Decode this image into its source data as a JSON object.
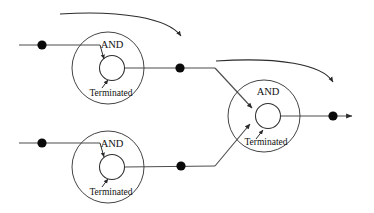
{
  "diagram": {
    "type": "workflow-petri-net",
    "colors": {
      "wire": "#4d4d4d",
      "stroke": "#2b2b2b",
      "dot": "#0a0a0a",
      "background": "#ffffff",
      "text": "#111111"
    },
    "nodes": [
      {
        "id": "node-top-left",
        "gate_label": "AND",
        "state_label": "Terminated",
        "cx": 108,
        "cy": 68,
        "outer_r": 36,
        "inner_cx": 112,
        "inner_cy": 68,
        "inner_r": 12.5
      },
      {
        "id": "node-bottom-left",
        "gate_label": "AND",
        "state_label": "Terminated",
        "cx": 108,
        "cy": 167,
        "outer_r": 36,
        "inner_cx": 112,
        "inner_cy": 167,
        "inner_r": 12.5
      },
      {
        "id": "node-right",
        "gate_label": "AND",
        "state_label": "Terminated",
        "cx": 264,
        "cy": 116,
        "outer_r": 36,
        "inner_cx": 268,
        "inner_cy": 116,
        "inner_r": 12.5
      }
    ],
    "tokens": [
      {
        "id": "token-input-top",
        "cx": 42,
        "cy": 45,
        "r": 4.6
      },
      {
        "id": "token-input-bottom",
        "cx": 42,
        "cy": 143,
        "r": 4.6
      },
      {
        "id": "token-output-top",
        "cx": 180,
        "cy": 68,
        "r": 4.6
      },
      {
        "id": "token-output-bottom",
        "cx": 181,
        "cy": 166,
        "r": 4.6
      },
      {
        "id": "token-output-final",
        "cx": 333,
        "cy": 116,
        "r": 4.6
      }
    ],
    "wires": [
      {
        "id": "wire-input-top",
        "d": "M 19 45 L 100 45"
      },
      {
        "id": "wire-input-bottom",
        "d": "M 19 143 L 100 143"
      },
      {
        "id": "wire-out-top",
        "d": "M 124 68 L 215 68"
      },
      {
        "id": "wire-out-bottom",
        "d": "M 124 167 L 215 166"
      },
      {
        "id": "wire-join-top",
        "d": "M 215 68 L 252 108"
      },
      {
        "id": "wire-join-bottom",
        "d": "M 215 166 L 250 124"
      },
      {
        "id": "wire-out-final",
        "d": "M 281 116 L 352 116"
      }
    ],
    "internal_arrows": [
      {
        "id": "arrow-top-and",
        "d": "M 100 45 L 104 59"
      },
      {
        "id": "arrow-top-term",
        "d": "M 102 88 L 108 80"
      },
      {
        "id": "arrow-bottom-and",
        "d": "M 100 143 L 104 157"
      },
      {
        "id": "arrow-bottom-term",
        "d": "M 102 187 L 108 179"
      },
      {
        "id": "arrow-right-term",
        "d": "M 256 139 L 263 130"
      }
    ],
    "feedback_curves": [
      {
        "id": "feedback-curve-top",
        "d": "M 60 14 C 120 10, 168 18, 181 36",
        "note": "curves over top-left node to arrowhead"
      },
      {
        "id": "feedback-curve-right",
        "d": "M 216 61 C 278 57, 322 64, 333 82",
        "note": "curves over right node to arrowhead"
      }
    ],
    "output_arrowhead": {
      "id": "arrowhead-final-output",
      "x": 355,
      "y": 116
    }
  }
}
